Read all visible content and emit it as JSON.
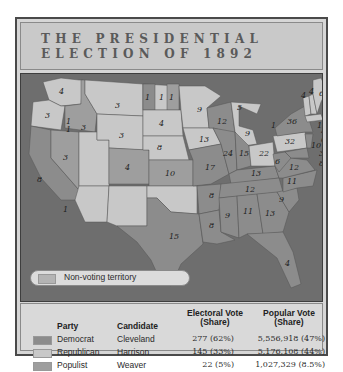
{
  "title": {
    "line1": "THE PRESIDENTIAL",
    "line2": "ELECTION OF 1892"
  },
  "colors": {
    "democrat": "#8c8c8c",
    "republican": "#c8c8c8",
    "populist": "#9e9e9e",
    "non_voting": "#b4b4b4",
    "water": "#6e6e6e"
  },
  "map": {
    "legend": {
      "non_voting_label": "Non-voting territory"
    },
    "state_labels": [
      {
        "state": "WA",
        "votes": "4"
      },
      {
        "state": "OR",
        "votes": "3"
      },
      {
        "state": "OR-Pop",
        "votes": "1"
      },
      {
        "state": "CA",
        "votes": "8"
      },
      {
        "state": "CA-Rep",
        "votes": "1"
      },
      {
        "state": "NV",
        "votes": "3"
      },
      {
        "state": "ID",
        "votes": "3"
      },
      {
        "state": "ID-split",
        "votes": "1"
      },
      {
        "state": "MT",
        "votes": "3"
      },
      {
        "state": "WY",
        "votes": "3"
      },
      {
        "state": "CO",
        "votes": "4"
      },
      {
        "state": "ND-1",
        "votes": "1"
      },
      {
        "state": "ND-2",
        "votes": "1"
      },
      {
        "state": "ND-3",
        "votes": "1"
      },
      {
        "state": "SD",
        "votes": "4"
      },
      {
        "state": "NE",
        "votes": "8"
      },
      {
        "state": "KS",
        "votes": "10"
      },
      {
        "state": "TX",
        "votes": "15"
      },
      {
        "state": "MN",
        "votes": "9"
      },
      {
        "state": "IA",
        "votes": "13"
      },
      {
        "state": "MO",
        "votes": "17"
      },
      {
        "state": "AR",
        "votes": "8"
      },
      {
        "state": "LA",
        "votes": "8"
      },
      {
        "state": "WI",
        "votes": "12"
      },
      {
        "state": "MI-1",
        "votes": "5"
      },
      {
        "state": "MI-2",
        "votes": "9"
      },
      {
        "state": "IL",
        "votes": "24"
      },
      {
        "state": "IN",
        "votes": "15"
      },
      {
        "state": "OH",
        "votes": "22"
      },
      {
        "state": "OH-split",
        "votes": "1"
      },
      {
        "state": "KY",
        "votes": "13"
      },
      {
        "state": "TN",
        "votes": "12"
      },
      {
        "state": "MS",
        "votes": "9"
      },
      {
        "state": "AL",
        "votes": "11"
      },
      {
        "state": "GA",
        "votes": "13"
      },
      {
        "state": "FL",
        "votes": "4"
      },
      {
        "state": "SC",
        "votes": "9"
      },
      {
        "state": "NC",
        "votes": "11"
      },
      {
        "state": "VA",
        "votes": "12"
      },
      {
        "state": "WV",
        "votes": "6"
      },
      {
        "state": "PA",
        "votes": "32"
      },
      {
        "state": "NY",
        "votes": "36"
      },
      {
        "state": "VT",
        "votes": "4"
      },
      {
        "state": "NH",
        "votes": "4"
      },
      {
        "state": "ME",
        "votes": "6"
      },
      {
        "state": "MA",
        "votes": "15"
      },
      {
        "state": "RI",
        "votes": "4"
      },
      {
        "state": "CT",
        "votes": "6"
      },
      {
        "state": "NJ",
        "votes": "10"
      },
      {
        "state": "DE",
        "votes": "3"
      },
      {
        "state": "MD",
        "votes": "8"
      }
    ]
  },
  "table": {
    "headers": {
      "party": "Party",
      "candidate": "Candidate",
      "electoral_1": "Electoral Vote",
      "electoral_2": "(Share)",
      "popular_1": "Popular Vote",
      "popular_2": "(Share)"
    },
    "rows": [
      {
        "party": "Democrat",
        "candidate": "Cleveland",
        "electoral": "277 (62%)",
        "popular": "5,556,918 (47%)"
      },
      {
        "party": "Republican",
        "candidate": "Harrison",
        "electoral": "145 (33%)",
        "popular": "5,176,108 (44%)"
      },
      {
        "party": "Populist",
        "candidate": "Weaver",
        "electoral": "22 (5%)",
        "popular": "1,027,329 (8.5%)"
      }
    ]
  }
}
